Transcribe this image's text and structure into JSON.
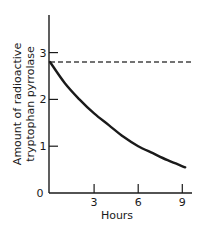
{
  "chart_data": {
    "type": "line",
    "title": "",
    "xlabel": "Hours",
    "ylabel": [
      "Amount of radioactive",
      "tryptophan pyrrolase"
    ],
    "xlim": [
      0,
      9.6
    ],
    "ylim": [
      0,
      4
    ],
    "x_ticks": [
      3,
      6,
      9
    ],
    "y_ticks": [
      0,
      1,
      2,
      3
    ],
    "grid": false,
    "legend": null,
    "series": [
      {
        "name": "radioactive tryptophan pyrrolase",
        "style": "solid",
        "x": [
          0,
          1,
          2,
          3,
          4,
          5,
          6,
          7,
          8,
          9.2
        ],
        "values": [
          2.8,
          2.35,
          2.0,
          1.7,
          1.45,
          1.2,
          1.0,
          0.85,
          0.7,
          0.55
        ]
      },
      {
        "name": "initial level reference",
        "style": "dashed",
        "x": [
          0,
          9.6
        ],
        "values": [
          2.8,
          2.8
        ]
      }
    ]
  },
  "labels": {
    "x_axis_title": "Hours",
    "y_axis_title_line1": "Amount of radioactive",
    "y_axis_title_line2": "tryptophan pyrrolase",
    "origin": "0"
  },
  "colors": {
    "ink": "#1a1a1a",
    "dashed": "#444444",
    "background": "#ffffff"
  }
}
